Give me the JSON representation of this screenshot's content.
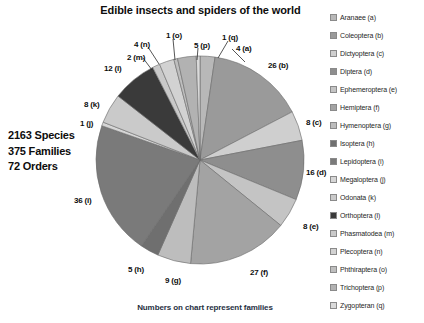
{
  "chart": {
    "title": "Edible insects and spiders of the world",
    "caption": "Numbers on chart represent families"
  },
  "summary": {
    "species": "2163 Species",
    "families": "375 Families",
    "orders": "72 Orders"
  },
  "legend": {
    "items": [
      {
        "label": "Aranaee (a)",
        "color": "#b8b8b8"
      },
      {
        "label": "Coleoptera (b)",
        "color": "#9a9a9a"
      },
      {
        "label": "Dictyoptera (c)",
        "color": "#cfcfcf"
      },
      {
        "label": "Diptera (d)",
        "color": "#8e8e8e"
      },
      {
        "label": "Ephemeroptera (e)",
        "color": "#c4c4c4"
      },
      {
        "label": "Hemiptera (f)",
        "color": "#a3a3a3"
      },
      {
        "label": "Hymenoptera (g)",
        "color": "#bdbdbd"
      },
      {
        "label": "Isoptera (h)",
        "color": "#6f6f6f"
      },
      {
        "label": "Lepidoptera (i)",
        "color": "#7a7a7a"
      },
      {
        "label": "Megaloptera (j)",
        "color": "#d6d6d6"
      },
      {
        "label": "Odonata (k)",
        "color": "#cacaca"
      },
      {
        "label": "Orthoptera (l)",
        "color": "#3a3a3a"
      },
      {
        "label": "Phasmatodea (m)",
        "color": "#c9c9c9"
      },
      {
        "label": "Plecoptera (n)",
        "color": "#d2d2d2"
      },
      {
        "label": "Phthiraptera (o)",
        "color": "#bebebe"
      },
      {
        "label": "Trichoptera (p)",
        "color": "#b2b2b2"
      },
      {
        "label": "Zygopteran (q)",
        "color": "#dadada"
      }
    ]
  },
  "chart_data": {
    "type": "pie",
    "title": "Edible insects and spiders of the world",
    "subtitle": "Numbers on chart represent families",
    "units": "families",
    "total": 173,
    "legend_position": "right",
    "categories": [
      "Aranaee (a)",
      "Coleoptera (b)",
      "Dictyoptera (c)",
      "Diptera (d)",
      "Ephemeroptera (e)",
      "Hemiptera (f)",
      "Hymenoptera (g)",
      "Isoptera (h)",
      "Lepidoptera (i)",
      "Megaloptera (j)",
      "Odonata (k)",
      "Orthoptera (l)",
      "Phasmatodea (m)",
      "Plecoptera (n)",
      "Phthiraptera (o)",
      "Trichoptera (p)",
      "Zygopteran (q)"
    ],
    "values": [
      4,
      26,
      8,
      16,
      8,
      27,
      9,
      5,
      36,
      1,
      8,
      12,
      2,
      4,
      1,
      5,
      1
    ],
    "slices": [
      {
        "key": "a",
        "label": "4 (a)",
        "value": 4,
        "color": "#b8b8b8",
        "label_x": 236,
        "label_y": 44
      },
      {
        "key": "b",
        "label": "26 (b)",
        "value": 26,
        "color": "#9a9a9a",
        "label_x": 268,
        "label_y": 61
      },
      {
        "key": "c",
        "label": "8 (c)",
        "value": 8,
        "color": "#cfcfcf",
        "label_x": 306,
        "label_y": 118
      },
      {
        "key": "d",
        "label": "16 (d)",
        "value": 16,
        "color": "#8e8e8e",
        "label_x": 306,
        "label_y": 168
      },
      {
        "key": "e",
        "label": "8 (e)",
        "value": 8,
        "color": "#c4c4c4",
        "label_x": 303,
        "label_y": 222
      },
      {
        "key": "f",
        "label": "27 (f)",
        "value": 27,
        "color": "#a3a3a3",
        "label_x": 250,
        "label_y": 268
      },
      {
        "key": "g",
        "label": "9 (g)",
        "value": 9,
        "color": "#bdbdbd",
        "label_x": 165,
        "label_y": 276
      },
      {
        "key": "h",
        "label": "5 (h)",
        "value": 5,
        "color": "#6f6f6f",
        "label_x": 128,
        "label_y": 265
      },
      {
        "key": "i",
        "label": "36 (i)",
        "value": 36,
        "color": "#7a7a7a",
        "label_x": 74,
        "label_y": 196
      },
      {
        "key": "j",
        "label": "1 (j)",
        "value": 1,
        "color": "#d6d6d6",
        "label_x": 80,
        "label_y": 119
      },
      {
        "key": "k",
        "label": "8 (k)",
        "value": 8,
        "color": "#cacaca",
        "label_x": 84,
        "label_y": 100
      },
      {
        "key": "l",
        "label": "12 (l)",
        "value": 12,
        "color": "#3a3a3a",
        "label_x": 104,
        "label_y": 64
      },
      {
        "key": "m",
        "label": "2 (m)",
        "value": 2,
        "color": "#c9c9c9",
        "label_x": 127,
        "label_y": 53
      },
      {
        "key": "n",
        "label": "4 (n)",
        "value": 4,
        "color": "#d2d2d2",
        "label_x": 134,
        "label_y": 40
      },
      {
        "key": "o",
        "label": "1 (o)",
        "value": 1,
        "color": "#bebebe",
        "label_x": 166,
        "label_y": 31
      },
      {
        "key": "p",
        "label": "5 (p)",
        "value": 5,
        "color": "#b2b2b2",
        "label_x": 194,
        "label_y": 41
      },
      {
        "key": "q",
        "label": "1 (q)",
        "value": 1,
        "color": "#dadada",
        "label_x": 222,
        "label_y": 33
      }
    ],
    "geometry": {
      "cx": 200,
      "cy": 160,
      "r": 104,
      "start_angle_deg": -90,
      "direction": "clockwise"
    },
    "leaders": [
      {
        "key": "n",
        "x1": 148,
        "y1": 47,
        "x2": 159,
        "y2": 64
      },
      {
        "key": "o",
        "x1": 173,
        "y1": 39,
        "x2": 175,
        "y2": 60
      },
      {
        "key": "p",
        "x1": 198,
        "y1": 48,
        "x2": 197,
        "y2": 60
      },
      {
        "key": "q",
        "x1": 228,
        "y1": 41,
        "x2": 218,
        "y2": 58
      },
      {
        "key": "a",
        "x1": 232,
        "y1": 49,
        "x2": 245,
        "y2": 62
      },
      {
        "key": "m",
        "x1": 143,
        "y1": 58,
        "x2": 152,
        "y2": 70
      }
    ]
  }
}
